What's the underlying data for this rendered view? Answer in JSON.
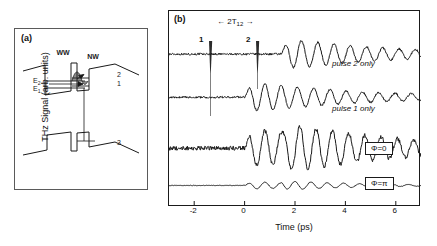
{
  "figure": {
    "panels": [
      {
        "id": "a",
        "label": "(a)",
        "caption_text": "(a)"
      },
      {
        "id": "b",
        "label": "(b)",
        "caption_text": "(b)"
      }
    ]
  },
  "panel_a": {
    "label": "(a)",
    "description": "Band diagram of a biased coupled double quantum well",
    "structure_labels": [
      {
        "name": "wide-well-label",
        "text": "WW"
      },
      {
        "name": "narrow-well-label",
        "text": "NW"
      }
    ],
    "energy_levels": [
      {
        "name": "level-E2",
        "base": "E",
        "sub": "2"
      },
      {
        "name": "level-E1",
        "base": "E",
        "sub": "1"
      }
    ],
    "transition_labels": [
      {
        "name": "state-2",
        "text": "2"
      },
      {
        "name": "state-1",
        "text": "1"
      },
      {
        "name": "state-3",
        "text": "3"
      }
    ]
  },
  "panel_b": {
    "label": "(b)",
    "annotation": {
      "prefix": "2T",
      "sub": "12"
    },
    "pulses": [
      {
        "name": "pulse-marker-1",
        "label": "1",
        "time_ps": 0.0
      },
      {
        "name": "pulse-marker-2",
        "label": "2",
        "time_ps": 1.45
      }
    ],
    "trace_captions": [
      {
        "name": "caption-pulse-2-only",
        "text": "pulse 2 only"
      },
      {
        "name": "caption-pulse-1-only",
        "text": "pulse 1 only"
      }
    ],
    "phase_labels": [
      {
        "name": "phase-label-zero",
        "text": "Φ=0"
      },
      {
        "name": "phase-label-pi",
        "text": "Φ=π"
      }
    ]
  },
  "chart_data": {
    "type": "line",
    "title": "",
    "xlabel": "Time (ps)",
    "ylabel": "THz Signal (arb. units)",
    "xlim": [
      -3.0,
      7.0
    ],
    "ylim": [
      0,
      1
    ],
    "xticks": [
      -2,
      0,
      2,
      4,
      6
    ],
    "xticklabels": [
      "-2",
      "0",
      "2",
      "4",
      "6"
    ],
    "yticks": [],
    "grid": false,
    "legend_position": "inline-right",
    "annotations": [
      {
        "text": "2T12",
        "type": "double-arrow-span",
        "x_start": 0.0,
        "x_end": 1.45
      },
      {
        "text": "1",
        "type": "pulse",
        "x": 0.0
      },
      {
        "text": "2",
        "type": "pulse",
        "x": 1.45
      }
    ],
    "series": [
      {
        "name": "pulse 2 only",
        "label": "pulse 2 only",
        "color": "#1a1a1a",
        "baseline_offset": 0.78,
        "onset_ps": 1.45,
        "amplitude": 0.085,
        "frequency_thz": 1.55,
        "damping_ps": 4.2
      },
      {
        "name": "pulse 1 only",
        "label": "pulse 1 only",
        "color": "#1a1a1a",
        "baseline_offset": 0.56,
        "onset_ps": 0.0,
        "amplitude": 0.085,
        "frequency_thz": 1.55,
        "damping_ps": 4.2
      },
      {
        "name": "phi=0",
        "label": "Φ=0",
        "color": "#1a1a1a",
        "baseline_offset": 0.3,
        "onset_ps": 0.0,
        "amplitude": 0.175,
        "frequency_thz": 1.55,
        "damping_ps": 4.6,
        "interference": "constructive"
      },
      {
        "name": "phi=pi",
        "label": "Φ=π",
        "color": "#1a1a1a",
        "baseline_offset": 0.11,
        "onset_ps": 0.0,
        "amplitude": 0.022,
        "frequency_thz": 1.55,
        "damping_ps": 3.0,
        "interference": "destructive"
      }
    ]
  }
}
